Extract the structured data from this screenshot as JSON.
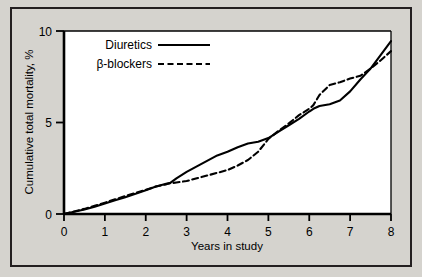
{
  "figure": {
    "background_color": "#d5d3ce",
    "plot_background_color": "#ffffff",
    "border_color": "#231f20",
    "line_color": "#000000"
  },
  "chart_data": {
    "type": "line",
    "title": "",
    "xlabel": "Years in study",
    "ylabel": "Cumulative total mortality, %",
    "xlim": [
      0,
      8
    ],
    "ylim": [
      0,
      10
    ],
    "xticks": [
      0,
      1,
      2,
      3,
      4,
      5,
      6,
      7,
      8
    ],
    "xticklabels": [
      "0",
      "1",
      "2",
      "3",
      "4",
      "5",
      "6",
      "7",
      "8"
    ],
    "yticks": [
      0,
      5,
      10
    ],
    "yticklabels": [
      "0",
      "5",
      "10"
    ],
    "grid": false,
    "legend_position": "upper-left-inside",
    "series": [
      {
        "name": "Diuretics",
        "style": "solid",
        "x": [
          0,
          0.25,
          0.5,
          0.75,
          1.0,
          1.25,
          1.5,
          1.75,
          2.0,
          2.25,
          2.5,
          2.6,
          2.75,
          3.0,
          3.25,
          3.5,
          3.75,
          4.0,
          4.25,
          4.5,
          4.75,
          5.0,
          5.25,
          5.5,
          5.75,
          6.0,
          6.1,
          6.25,
          6.5,
          6.75,
          7.0,
          7.25,
          7.5,
          7.75,
          8.0
        ],
        "y": [
          0.0,
          0.12,
          0.25,
          0.4,
          0.58,
          0.75,
          0.92,
          1.1,
          1.3,
          1.5,
          1.65,
          1.7,
          1.95,
          2.3,
          2.6,
          2.9,
          3.2,
          3.4,
          3.65,
          3.85,
          3.95,
          4.15,
          4.5,
          4.85,
          5.2,
          5.6,
          5.75,
          5.9,
          6.0,
          6.2,
          6.7,
          7.35,
          7.95,
          8.7,
          9.45
        ]
      },
      {
        "name": "β-blockers",
        "style": "dashed",
        "x": [
          0,
          0.25,
          0.5,
          0.75,
          1.0,
          1.25,
          1.5,
          1.75,
          2.0,
          2.25,
          2.5,
          2.6,
          2.75,
          3.0,
          3.25,
          3.5,
          3.75,
          4.0,
          4.25,
          4.5,
          4.75,
          5.0,
          5.25,
          5.5,
          5.75,
          6.0,
          6.1,
          6.25,
          6.5,
          6.75,
          7.0,
          7.25,
          7.5,
          7.75,
          8.0
        ],
        "y": [
          0.0,
          0.14,
          0.28,
          0.45,
          0.62,
          0.8,
          0.98,
          1.15,
          1.32,
          1.5,
          1.62,
          1.68,
          1.72,
          1.8,
          1.95,
          2.1,
          2.25,
          2.4,
          2.65,
          2.95,
          3.4,
          4.1,
          4.55,
          4.95,
          5.4,
          5.75,
          5.95,
          6.5,
          7.05,
          7.2,
          7.4,
          7.55,
          7.95,
          8.4,
          8.9
        ]
      }
    ],
    "legend": [
      {
        "label": "Diuretics",
        "style": "solid"
      },
      {
        "label": "β-blockers",
        "style": "dashed"
      }
    ]
  }
}
